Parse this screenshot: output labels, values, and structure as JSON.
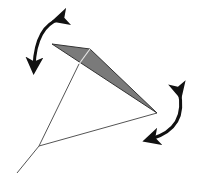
{
  "diagram": {
    "colors": {
      "background": "#ffffff",
      "wing_fill": "#7a7a7a",
      "wing_stroke": "#333333",
      "line": "#555555",
      "spar": "#e6e6e6",
      "arrow": "#111111"
    },
    "wing": {
      "left_tip": [
        52,
        44
      ],
      "top_vertex": [
        90,
        49
      ],
      "right_tip": [
        157,
        113
      ]
    },
    "lines": {
      "spar": {
        "from": [
          90,
          49
        ],
        "to": [
          79,
          64
        ]
      },
      "front_line": {
        "from": [
          79,
          64
        ],
        "to": [
          39,
          146
        ]
      },
      "rear_line": {
        "from": [
          39,
          146
        ],
        "to": [
          157,
          113
        ]
      },
      "tail_line": {
        "from": [
          39,
          146
        ],
        "to": [
          17,
          173
        ]
      }
    },
    "arrows": [
      {
        "name": "rotation-arrow-top-left",
        "type": "double-headed-curved",
        "start": [
          63,
          18
        ],
        "end": [
          34,
          70
        ]
      },
      {
        "name": "rotation-arrow-right",
        "type": "double-headed-curved",
        "start": [
          180,
          88
        ],
        "end": [
          148,
          141
        ]
      }
    ]
  }
}
